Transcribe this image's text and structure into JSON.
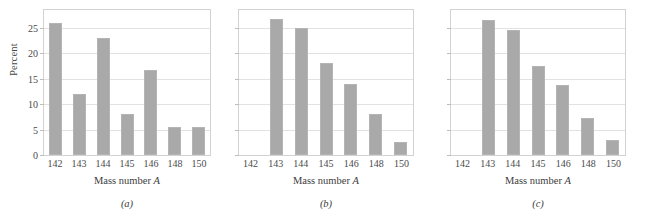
{
  "figure": {
    "axis_label_x": "Mass number",
    "axis_label_x_symbol": "A",
    "axis_label_y": "Percent"
  },
  "chart_data": [
    {
      "type": "bar",
      "title": "",
      "panel_label": "(a)",
      "xlabel": "Mass number A",
      "ylabel": "Percent",
      "categories": [
        "142",
        "143",
        "144",
        "145",
        "146",
        "148",
        "150"
      ],
      "values": [
        26,
        12,
        23,
        8,
        16.8,
        5.5,
        5.5
      ],
      "ylim": [
        0,
        28.5
      ],
      "yticks": [
        0,
        5,
        10,
        15,
        20,
        25
      ],
      "ytick_labels": [
        "0",
        "5",
        "10",
        "15",
        "20",
        "25"
      ],
      "show_ytick_labels": true,
      "grid": true,
      "bar_color": "#a9a9a9"
    },
    {
      "type": "bar",
      "title": "",
      "panel_label": "(b)",
      "xlabel": "Mass number A",
      "ylabel": "",
      "categories": [
        "142",
        "143",
        "144",
        "145",
        "146",
        "148",
        "150"
      ],
      "values": [
        0,
        26.8,
        25,
        18,
        14,
        8,
        2.5
      ],
      "ylim": [
        0,
        28.5
      ],
      "yticks": [
        0,
        5,
        10,
        15,
        20,
        25
      ],
      "ytick_labels": [
        "",
        "",
        "",
        "",
        "",
        ""
      ],
      "show_ytick_labels": false,
      "grid": true,
      "bar_color": "#a9a9a9"
    },
    {
      "type": "bar",
      "title": "",
      "panel_label": "(c)",
      "xlabel": "Mass number A",
      "ylabel": "",
      "categories": [
        "142",
        "143",
        "144",
        "145",
        "146",
        "148",
        "150"
      ],
      "values": [
        0,
        26.5,
        24.5,
        17.5,
        13.8,
        7.3,
        3
      ],
      "ylim": [
        0,
        28.5
      ],
      "yticks": [
        0,
        5,
        10,
        15,
        20,
        25
      ],
      "ytick_labels": [
        "",
        "",
        "",
        "",
        "",
        ""
      ],
      "show_ytick_labels": false,
      "grid": true,
      "bar_color": "#a9a9a9"
    }
  ]
}
